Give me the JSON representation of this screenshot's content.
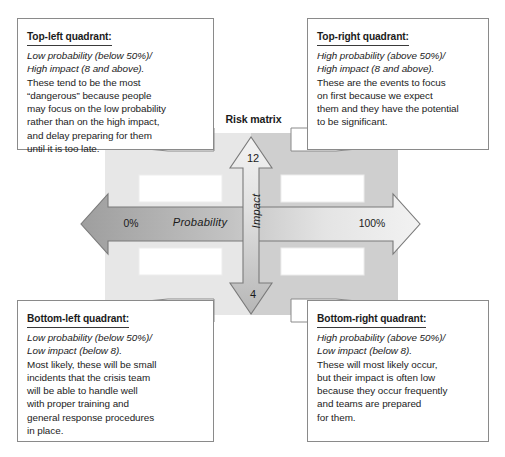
{
  "diagram": {
    "title": "Risk matrix",
    "axes": {
      "x": {
        "label": "Probability",
        "min_label": "0%",
        "max_label": "100%"
      },
      "y": {
        "label": "Impact",
        "max_label": "12",
        "min_label": "4"
      }
    },
    "quadrant_placeholders": [
      "",
      "",
      "",
      ""
    ]
  },
  "callouts": {
    "top_left": {
      "heading": "Top-left quadrant:",
      "italic_lines": [
        "Low probability (below 50%)/",
        "High impact (8 and above)."
      ],
      "body_lines": [
        "These tend to be the most",
        "“dangerous” because people",
        "may focus on the low probability",
        "rather than on the high impact,",
        "and delay preparing for them",
        "until it is too late."
      ]
    },
    "top_right": {
      "heading": "Top-right quadrant:",
      "italic_lines": [
        "High probability (above 50%)/",
        "High impact (8 and above)."
      ],
      "body_lines": [
        "These are the events to focus",
        "on first because we expect",
        "them and they have the potential",
        "to be significant."
      ]
    },
    "bottom_left": {
      "heading": "Bottom-left quadrant:",
      "italic_lines": [
        "Low probability (below 50%)/",
        "Low impact (below 8)."
      ],
      "body_lines": [
        "Most likely, these will be small",
        "incidents that the crisis team",
        "will be able to handle well",
        "with proper training and",
        "general response procedures",
        "in place."
      ]
    },
    "bottom_right": {
      "heading": "Bottom-right quadrant:",
      "italic_lines": [
        "High probability (above 50%)/",
        "Low impact (below 8)."
      ],
      "body_lines": [
        "These will most likely occur,",
        "but their impact is often low",
        "because they occur frequently",
        "and teams are prepared",
        "for them."
      ]
    }
  },
  "colors": {
    "page_background": "#ffffff",
    "matrix_light": "#e2e2e2",
    "matrix_dark": "#cfcfcf",
    "arrow_outline": "#7a7a7a",
    "arrow_light": "#e8e8e8",
    "arrow_dark": "#a8a8a8",
    "box_border": "#8a8a8a",
    "text": "#1b1b1b"
  }
}
